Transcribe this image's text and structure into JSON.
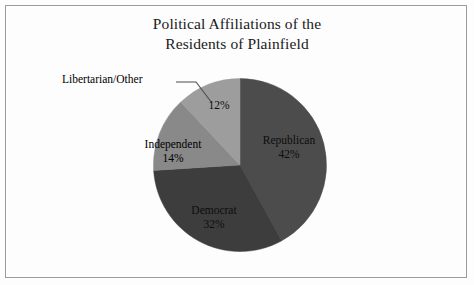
{
  "frame": {
    "border_color": "#9b9b9b",
    "background": "#fdfdfd"
  },
  "chart_data": {
    "type": "pie",
    "title": "Political Affiliations of the Residents of Plainfield",
    "title_line_1": "Political Affiliations of the",
    "title_line_2": "Residents of Plainfield",
    "xlabel": "",
    "ylabel": "",
    "legend_position": "none",
    "grid": false,
    "start_angle_deg": 0,
    "direction": "clockwise",
    "categories": [
      "Republican",
      "Democrat",
      "Independent",
      "Libertarian/Other"
    ],
    "values": [
      42,
      32,
      14,
      12
    ],
    "unit": "%",
    "labels": [
      "42%",
      "32%",
      "14%",
      "12%"
    ],
    "colors": [
      "#4c4c4c",
      "#3d3d3d",
      "#898989",
      "#9d9d9d"
    ],
    "slices": [
      {
        "name": "Republican",
        "value": 42,
        "label": "42%",
        "color": "#4c4c4c",
        "start_deg": 0,
        "end_deg": 151.2,
        "label_placement": "inside"
      },
      {
        "name": "Democrat",
        "value": 32,
        "label": "32%",
        "color": "#3d3d3d",
        "start_deg": 151.2,
        "end_deg": 266.4,
        "label_placement": "inside"
      },
      {
        "name": "Independent",
        "value": 14,
        "label": "14%",
        "color": "#898989",
        "start_deg": 266.4,
        "end_deg": 316.8,
        "label_placement": "outside-left"
      },
      {
        "name": "Libertarian/Other",
        "value": 12,
        "label": "12%",
        "color": "#9d9d9d",
        "start_deg": 316.8,
        "end_deg": 360,
        "label_placement": "callout"
      }
    ]
  },
  "annotations": {
    "libertarian_callout": {
      "text": "Libertarian/Other",
      "leader_color": "#4d4d4d"
    }
  }
}
